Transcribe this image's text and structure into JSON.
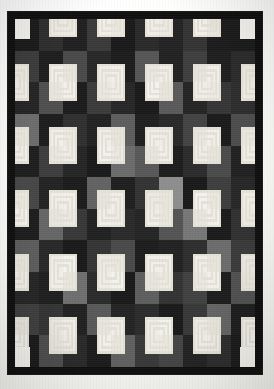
{
  "figure": {
    "caption": "",
    "background_color": "#ffffff"
  },
  "quilt": {
    "name": "log-cabin-quilt",
    "border_color": "#100f0f",
    "border_width_px": 7,
    "grid": {
      "columns": 10,
      "rows": 11
    },
    "block_size_px": 24,
    "logs_per_block": 6,
    "palette": {
      "light": "#f2f0ea",
      "light_alt": "#e4e1d8",
      "mid_gray": "#8d8d8d",
      "gray": "#6b6b6b",
      "dark_gray": "#3c3b3b",
      "dark": "#262525",
      "black": "#121111",
      "center": "#f5f3ee"
    },
    "block_orientations": [
      [
        "tl",
        "tr",
        "tl",
        "tr",
        "tl",
        "tr",
        "tl",
        "tr",
        "tl",
        "tr"
      ],
      [
        "bl",
        "br",
        "bl",
        "br",
        "bl",
        "br",
        "bl",
        "br",
        "bl",
        "br"
      ],
      [
        "tl",
        "tr",
        "tl",
        "tr",
        "tl",
        "tr",
        "tl",
        "tr",
        "tl",
        "tr"
      ],
      [
        "bl",
        "br",
        "bl",
        "br",
        "bl",
        "br",
        "bl",
        "br",
        "bl",
        "br"
      ],
      [
        "tl",
        "tr",
        "tl",
        "tr",
        "tl",
        "tr",
        "tl",
        "tr",
        "tl",
        "tr"
      ],
      [
        "bl",
        "br",
        "bl",
        "br",
        "bl",
        "br",
        "bl",
        "br",
        "bl",
        "br"
      ],
      [
        "tl",
        "tr",
        "tl",
        "tr",
        "tl",
        "tr",
        "tl",
        "tr",
        "tl",
        "tr"
      ],
      [
        "bl",
        "br",
        "bl",
        "br",
        "bl",
        "br",
        "bl",
        "br",
        "bl",
        "br"
      ],
      [
        "tl",
        "tr",
        "tl",
        "tr",
        "tl",
        "tr",
        "tl",
        "tr",
        "tl",
        "tr"
      ],
      [
        "bl",
        "br",
        "bl",
        "br",
        "bl",
        "br",
        "bl",
        "br",
        "bl",
        "br"
      ],
      [
        "tl",
        "tr",
        "tl",
        "tr",
        "tl",
        "tr",
        "tl",
        "tr",
        "tl",
        "tr"
      ]
    ],
    "block_light_shades": [
      [
        "#f4f2ec",
        "#efece5",
        "#eeebe3",
        "#f2efe8",
        "#eae7df",
        "#f1eee7",
        "#eceae2",
        "#f3f0e9",
        "#e9e6de",
        "#f4f2ec"
      ],
      [
        "#edeae2",
        "#f2efe8",
        "#e9e6de",
        "#f0ede6",
        "#f3f0e9",
        "#ebe8e0",
        "#f1eee7",
        "#e8e5dd",
        "#f2efe8",
        "#edeae2"
      ],
      [
        "#f1eee7",
        "#e9e6de",
        "#f3f0e9",
        "#ebe8e0",
        "#f0ede6",
        "#f4f2ec",
        "#e8e5dd",
        "#f1eee7",
        "#eceae2",
        "#f0ede6"
      ],
      [
        "#e9e6de",
        "#f3f0e9",
        "#edeae2",
        "#f1eee7",
        "#e8e5dd",
        "#f2efe8",
        "#f0ede6",
        "#eae7df",
        "#f3f0e9",
        "#ebe8e0"
      ],
      [
        "#f2efe8",
        "#ebe8e0",
        "#f0ede6",
        "#f4f2ec",
        "#eceae2",
        "#e9e6de",
        "#f3f0e9",
        "#f0ede6",
        "#e8e5dd",
        "#f1eee7"
      ],
      [
        "#eae7df",
        "#f1eee7",
        "#f3f0e9",
        "#e8e5dd",
        "#f2efe8",
        "#edeae2",
        "#e9e6de",
        "#f4f2ec",
        "#ebe8e0",
        "#f0ede6"
      ],
      [
        "#f3f0e9",
        "#e8e5dd",
        "#eceae2",
        "#f2efe8",
        "#f0ede6",
        "#f1eee7",
        "#eae7df",
        "#e9e6de",
        "#f3f0e9",
        "#edeae2"
      ],
      [
        "#e9e6de",
        "#f0ede6",
        "#f4f2ec",
        "#edeae2",
        "#ebe8e0",
        "#f3f0e9",
        "#f2efe8",
        "#f1eee7",
        "#e8e5dd",
        "#eceae2"
      ],
      [
        "#f1eee7",
        "#f2efe8",
        "#e9e6de",
        "#f0ede6",
        "#f4f2ec",
        "#e8e5dd",
        "#edeae2",
        "#ebe8e0",
        "#f3f0e9",
        "#eae7df"
      ],
      [
        "#ebe8e0",
        "#eceae2",
        "#f2efe8",
        "#e9e6de",
        "#f1eee7",
        "#f0ede6",
        "#f4f2ec",
        "#edeae2",
        "#e8e5dd",
        "#f3f0e9"
      ],
      [
        "#f4f2ec",
        "#eae7df",
        "#f0ede6",
        "#f3f0e9",
        "#e9e6de",
        "#eceae2",
        "#ebe8e0",
        "#f2efe8",
        "#f1eee7",
        "#f4f2ec"
      ]
    ],
    "block_dark_shades": [
      [
        "#1b1a1a",
        "#2e2d2d",
        "#201f1f",
        "#3a3939",
        "#1a1919",
        "#2a2929",
        "#232222",
        "#343333",
        "#1c1b1b",
        "#1b1a1a"
      ],
      [
        "#3c3b3b",
        "#1e1d1d",
        "#4a4949",
        "#282727",
        "#1d1c1c",
        "#565555",
        "#222121",
        "#3f3e3e",
        "#1f1e1e",
        "#2b2a2a"
      ],
      [
        "#242323",
        "#4f4e4e",
        "#1c1b1b",
        "#3b3a3a",
        "#272626",
        "#1a1919",
        "#5a5959",
        "#252424",
        "#363535",
        "#2d2c2c"
      ],
      [
        "#6b6b6b",
        "#1d1c1c",
        "#302f2f",
        "#222121",
        "#5e5d5d",
        "#1f1e1e",
        "#292828",
        "#434242",
        "#1b1a1a",
        "#4d4c4c"
      ],
      [
        "#1e1d1d",
        "#3d3c3c",
        "#262525",
        "#1a1919",
        "#6b6b6b",
        "#585757",
        "#1d1c1c",
        "#2c2b2b",
        "#4b4a4a",
        "#212020"
      ],
      [
        "#474646",
        "#232222",
        "#1c1b1b",
        "#626161",
        "#1f1e1e",
        "#333232",
        "#8d8d8d",
        "#1a1919",
        "#3e3d3d",
        "#272626"
      ],
      [
        "#1d1c1c",
        "#666565",
        "#383737",
        "#202020",
        "#2a2929",
        "#252424",
        "#545353",
        "#777676",
        "#1b1a1a",
        "#313030"
      ],
      [
        "#5c5b5b",
        "#282727",
        "#1a1919",
        "#353434",
        "#4a4949",
        "#1d1c1c",
        "#222121",
        "#2e2d2d",
        "#6b6b6b",
        "#3a3939"
      ],
      [
        "#262525",
        "#1f1e1e",
        "#6f6e6e",
        "#2b2a2a",
        "#1a1919",
        "#5e5d5d",
        "#333232",
        "#414040",
        "#1d1c1c",
        "#505050"
      ],
      [
        "#3f3e3e",
        "#343333",
        "#212020",
        "#595858",
        "#242323",
        "#2c2b2b",
        "#1a1919",
        "#383737",
        "#646363",
        "#1e1d1d"
      ],
      [
        "#1b1a1a",
        "#4e4d4d",
        "#2a2929",
        "#1c1b1b",
        "#605f5f",
        "#393838",
        "#454444",
        "#232222",
        "#2d2c2c",
        "#1b1a1a"
      ]
    ]
  },
  "legend": {
    "light_label": "light logs",
    "dark_label": "dark logs",
    "center_label": "center square"
  }
}
